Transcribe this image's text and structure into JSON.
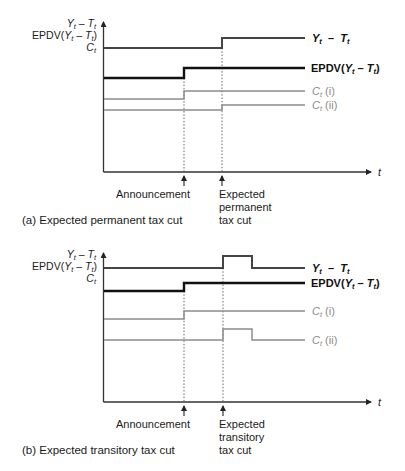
{
  "figure": {
    "panels": [
      {
        "id": "a",
        "caption": "(a) Expected permanent tax cut",
        "y_axis_labels": {
          "yt": {
            "main": "Y",
            "sub": "t",
            "rest": " – ",
            "main2": "T",
            "sub2": "t"
          },
          "epdv": {
            "prefix": "EPDV(",
            "main": "Y",
            "sub": "t",
            "rest": " – ",
            "main2": "T",
            "sub2": "t",
            "suffix": ")"
          },
          "c": {
            "main": "C",
            "sub": "t"
          }
        },
        "x_axis_label": "t",
        "events": [
          {
            "label_lines": [
              "Announcement"
            ]
          },
          {
            "label_lines": [
              "Expected",
              "permanent",
              "tax cut"
            ]
          }
        ],
        "series_labels": {
          "yt": {
            "main": "Y",
            "sub": "t",
            "rest": "  –  ",
            "main2": "T",
            "sub2": "t"
          },
          "epdv": {
            "prefix": "EPDV(",
            "main": "Y",
            "sub": "t",
            "rest": " – ",
            "main2": "T",
            "sub2": "t",
            "suffix": ")"
          },
          "c1": {
            "main": "C",
            "sub": "t",
            "rest": " (i)"
          },
          "c2": {
            "main": "C",
            "sub": "t",
            "rest": " (ii)"
          }
        }
      },
      {
        "id": "b",
        "caption": "(b) Expected transitory tax cut",
        "y_axis_labels": {
          "yt": {
            "main": "Y",
            "sub": "t",
            "rest": " – ",
            "main2": "T",
            "sub2": "t"
          },
          "epdv": {
            "prefix": "EPDV(",
            "main": "Y",
            "sub": "t",
            "rest": " – ",
            "main2": "T",
            "sub2": "t",
            "suffix": ")"
          },
          "c": {
            "main": "C",
            "sub": "t"
          }
        },
        "x_axis_label": "t",
        "events": [
          {
            "label_lines": [
              "Announcement"
            ]
          },
          {
            "label_lines": [
              "Expected",
              "transitory",
              "tax cut"
            ]
          }
        ],
        "series_labels": {
          "yt": {
            "main": "Y",
            "sub": "t",
            "rest": "  –  ",
            "main2": "T",
            "sub2": "t"
          },
          "epdv": {
            "prefix": "EPDV(",
            "main": "Y",
            "sub": "t",
            "rest": " – ",
            "main2": "T",
            "sub2": "t",
            "suffix": ")"
          },
          "c1": {
            "main": "C",
            "sub": "t",
            "rest": " (i)"
          },
          "c2": {
            "main": "C",
            "sub": "t",
            "rest": " (ii)"
          }
        }
      }
    ],
    "colors": {
      "yt_line": "#454545",
      "epdv_line": "#111111",
      "c_lines": "#8c8c8c",
      "axis": "#333333"
    }
  }
}
